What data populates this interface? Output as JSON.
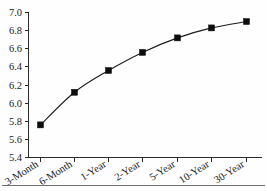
{
  "chart_data": {
    "type": "line",
    "title": "",
    "subtitle": "",
    "xlabel": "",
    "ylabel": "",
    "categories": [
      "3-Month",
      "6-Month",
      "1-Year",
      "2-Year",
      "5-Year",
      "10-Year",
      "30-Year"
    ],
    "values": [
      5.76,
      6.12,
      6.36,
      6.56,
      6.72,
      6.83,
      6.9
    ],
    "series": [
      {
        "name": "Yield",
        "values": [
          5.76,
          6.12,
          6.36,
          6.56,
          6.72,
          6.83,
          6.9
        ]
      }
    ],
    "ylim": [
      5.4,
      7.0
    ],
    "ytick_labels": [
      "5.4",
      "5.6",
      "5.8",
      "6.0",
      "6.2",
      "6.4",
      "6.6",
      "6.8",
      "7.0"
    ],
    "ytick_values": [
      5.4,
      5.6,
      5.8,
      6.0,
      6.2,
      6.4,
      6.6,
      6.8,
      7.0
    ],
    "xtick_labels": [
      "3-Month",
      "6-Month",
      "1-Year",
      "2-Year",
      "5-Year",
      "10-Year",
      "30-Year"
    ],
    "grid": false,
    "legend": null,
    "legend_position": "none",
    "marker": "square",
    "line_color": "#1b1b1b",
    "marker_color": "#0d0d0d",
    "background_color": "#fefefe",
    "axis_color": "#2b2b2b",
    "xtick_label_rotation": -32,
    "annotations": []
  },
  "figure": {
    "footer_rule_visible": true
  }
}
